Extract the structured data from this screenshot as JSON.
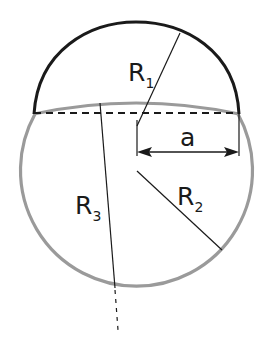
{
  "labels": {
    "r1": {
      "main": "R",
      "sub": "1"
    },
    "r2": {
      "main": "R",
      "sub": "2"
    },
    "r3": {
      "main": "R",
      "sub": "3"
    },
    "a": "a"
  },
  "colors": {
    "cap_arc": "#1a1a1a",
    "sphere": "#9a9a9a",
    "lines": "#1a1a1a",
    "background": "#ffffff"
  }
}
